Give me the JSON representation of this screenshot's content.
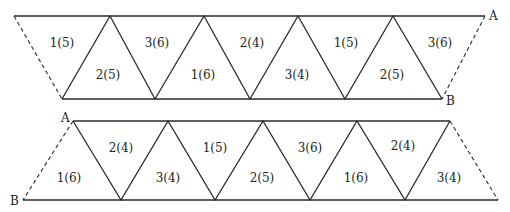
{
  "top_strip": {
    "point_a": "A",
    "point_b": "B",
    "up_faces": [
      "1(5)",
      "3(6)",
      "2(4)",
      "1(5)",
      "3(6)"
    ],
    "down_faces": [
      "2(5)",
      "1(6)",
      "3(4)",
      "2(5)"
    ]
  },
  "bottom_strip": {
    "point_a": "A",
    "point_b": "B",
    "up_faces": [
      "2(4)",
      "1(5)",
      "3(6)",
      "2(4)"
    ],
    "down_faces": [
      "1(6)",
      "3(4)",
      "2(5)",
      "1(6)",
      "3(4)"
    ]
  }
}
